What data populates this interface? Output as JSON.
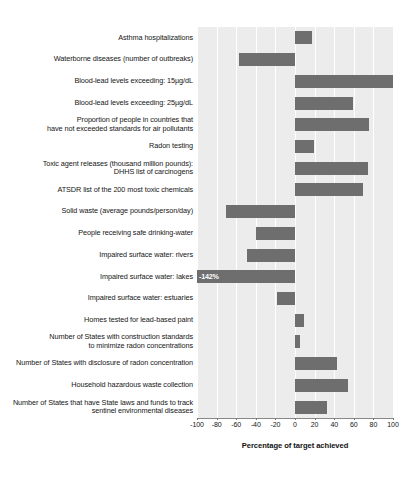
{
  "chart_data": {
    "type": "bar",
    "orientation": "horizontal",
    "title": "",
    "xlabel": "Percentage of target achieved",
    "ylabel": "",
    "xlim": [
      -100,
      100
    ],
    "xticks": [
      -100,
      -80,
      -60,
      -40,
      -20,
      0,
      20,
      40,
      60,
      80,
      100
    ],
    "xtick_labels": [
      "-100",
      "-80",
      "-60",
      "-40",
      "-20",
      "0",
      "20",
      "40",
      "60",
      "80",
      "100"
    ],
    "grid": true,
    "grid_orientation": "vertical",
    "legend": "none",
    "bar_color": "#6e6e6e",
    "plot_background": "#ececec",
    "categories": [
      "Asthma hospitalizations",
      "Waterborne diseases (number of outbreaks)",
      "Blood-lead levels exceeding: 15µg/dL",
      "Blood-lead levels exceeding: 25µg/dL",
      "Proportion of people in countries that have not exceeded standards for air pollutants",
      "Radon testing",
      "Toxic agent releases (thousand million pounds): DHHS list of carcinogens",
      "ATSDR list of the 200 most toxic chemicals",
      "Solid waste (average pounds/person/day)",
      "People receiving safe drinking-water",
      "Impaired surface water: rivers",
      "Impaired surface water: lakes",
      "Impaired surface water: estuaries",
      "Homes tested for lead-based paint",
      "Number of States with construction standards to minimize radon concentrations",
      "Number of States with disclosure of radon concentration",
      "Household hazardous waste collection",
      "Number of States that have State laws and funds to track sentinel environmental diseases"
    ],
    "category_lines": [
      [
        "Asthma hospitalizations"
      ],
      [
        "Waterborne diseases (number of outbreaks)"
      ],
      [
        "Blood-lead levels exceeding: 15µg/dL"
      ],
      [
        "Blood-lead levels exceeding: 25µg/dL"
      ],
      [
        "Proportion of people in countries that",
        "have not exceeded standards for air pollutants"
      ],
      [
        "Radon testing"
      ],
      [
        "Toxic agent releases (thousand million pounds):",
        "DHHS list of carcinogens"
      ],
      [
        "ATSDR list of the 200 most toxic chemicals"
      ],
      [
        "Solid waste (average pounds/person/day)"
      ],
      [
        "People receiving safe drinking-water"
      ],
      [
        "Impaired surface water: rivers"
      ],
      [
        "Impaired surface water: lakes"
      ],
      [
        "Impaired surface water: estuaries"
      ],
      [
        "Homes tested for lead-based paint"
      ],
      [
        "Number of States with construction standards",
        "to minimize radon concentrations"
      ],
      [
        "Number of States with disclosure of radon concentration"
      ],
      [
        "Household hazardous waste collection"
      ],
      [
        "Number of States that have State laws and funds to track",
        "sentinel environmental diseases"
      ]
    ],
    "values": [
      17,
      -57,
      100,
      59,
      76,
      19,
      74,
      69,
      -70,
      -40,
      -49,
      -142,
      -18,
      9,
      5,
      43,
      54,
      33
    ],
    "value_labels": [
      null,
      null,
      null,
      null,
      null,
      null,
      null,
      null,
      null,
      null,
      null,
      "-142%",
      null,
      null,
      null,
      null,
      null,
      null
    ],
    "clipped": [
      false,
      false,
      false,
      false,
      false,
      false,
      false,
      false,
      false,
      false,
      false,
      true,
      false,
      false,
      false,
      false,
      false,
      false
    ]
  }
}
